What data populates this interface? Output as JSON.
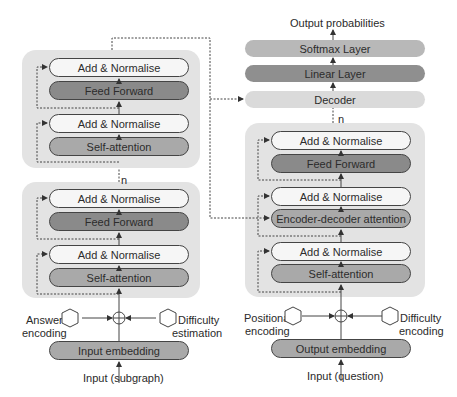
{
  "output_label": "Output probabilities",
  "decoder_stack": {
    "softmax": "Softmax Layer",
    "linear": "Linear Layer",
    "decoder": "Decoder",
    "repeat": "n"
  },
  "encoder": {
    "top_block": {
      "add_norm_1": "Add & Normalise",
      "feed_forward": "Feed Forward",
      "add_norm_2": "Add & Normalise",
      "self_attention": "Self-attention"
    },
    "repeat": "n",
    "bottom_block": {
      "add_norm_1": "Add & Normalise",
      "feed_forward": "Feed Forward",
      "add_norm_2": "Add & Normalise",
      "self_attention": "Self-attention"
    },
    "left_input": "Answer encoding",
    "left_input_line1": "Answer",
    "left_input_line2": "encoding",
    "right_input_line1": "Difficulty",
    "right_input_line2": "estimation",
    "embedding": "Input embedding",
    "input": "Input (subgraph)"
  },
  "decoder": {
    "add_norm_1": "Add & Normalise",
    "feed_forward": "Feed Forward",
    "add_norm_2": "Add & Normalise",
    "enc_dec_attention": "Encoder-decoder attention",
    "add_norm_3": "Add & Normalise",
    "self_attention": "Self-attention",
    "left_input_line1": "Positional",
    "left_input_line2": "encoding",
    "right_input_line1": "Difficulty",
    "right_input_line2": "encoding",
    "embedding": "Output embedding",
    "input": "Input (question)"
  },
  "colors": {
    "container": "#e3e3e3",
    "add_norm": "#f6f6f6",
    "feed_forward": "#8a8a8a",
    "attention": "#a9a9a9",
    "softmax": "#b8b8b8",
    "linear": "#8f8f8f",
    "decoder_bar": "#dadada"
  }
}
